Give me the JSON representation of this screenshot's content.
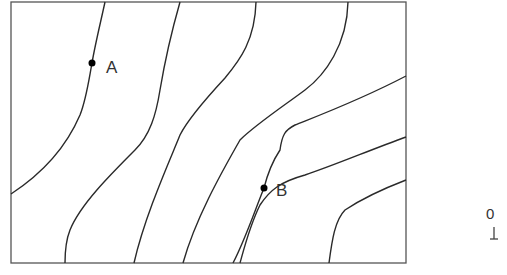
{
  "diagram": {
    "type": "contour-map",
    "frame": {
      "x": 11,
      "y": 2,
      "width": 395,
      "height": 261
    },
    "points": [
      {
        "label": "A",
        "x": 92,
        "y": 63,
        "label_x": 106,
        "label_y": 58
      },
      {
        "label": "B",
        "x": 264,
        "y": 188,
        "label_x": 276,
        "label_y": 182
      }
    ],
    "contour_count": 8,
    "line_color": "#2a2a2a"
  },
  "scale": {
    "zero_label": "0"
  }
}
